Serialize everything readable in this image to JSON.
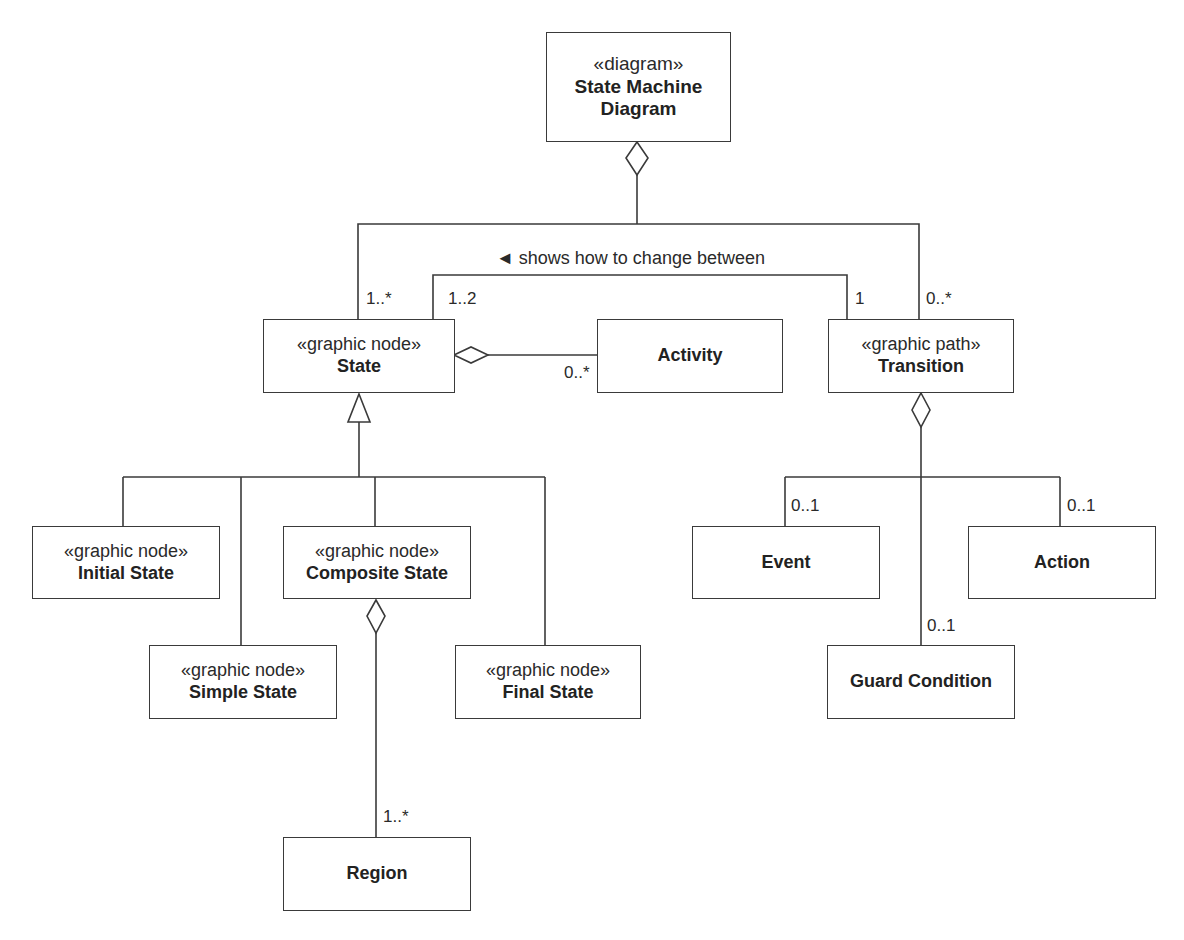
{
  "diagram": {
    "classes": {
      "state_machine_diagram": {
        "stereotype": "«diagram»",
        "name_line1": "State Machine",
        "name_line2": "Diagram"
      },
      "state": {
        "stereotype": "«graphic node»",
        "name": "State"
      },
      "activity": {
        "name": "Activity"
      },
      "transition": {
        "stereotype": "«graphic path»",
        "name": "Transition"
      },
      "initial_state": {
        "stereotype": "«graphic node»",
        "name": "Initial State"
      },
      "composite_state": {
        "stereotype": "«graphic node»",
        "name": "Composite State"
      },
      "simple_state": {
        "stereotype": "«graphic node»",
        "name": "Simple State"
      },
      "final_state": {
        "stereotype": "«graphic node»",
        "name": "Final State"
      },
      "region": {
        "name": "Region"
      },
      "event": {
        "name": "Event"
      },
      "action": {
        "name": "Action"
      },
      "guard_condition": {
        "name": "Guard Condition"
      }
    },
    "associations": {
      "change_between": {
        "label": "◄ shows how to change between"
      }
    },
    "multiplicities": {
      "diagram_state": "1..*",
      "diagram_transition": "0..*",
      "transition_state": "1..2",
      "state_transition": "1",
      "state_activity": "0..*",
      "composite_region": "1..*",
      "transition_event": "0..1",
      "transition_action": "0..1",
      "transition_guard": "0..1"
    }
  }
}
